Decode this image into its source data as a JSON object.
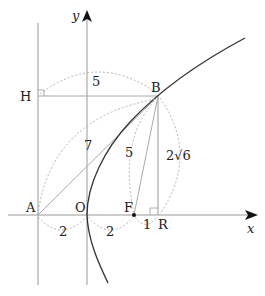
{
  "diagram": {
    "axes": {
      "x_label": "x",
      "y_label": "y"
    },
    "points": {
      "A": "A",
      "O": "O",
      "F": "F",
      "R": "R",
      "B": "B",
      "H": "H"
    },
    "lengths": {
      "HB": "5",
      "AB": "7",
      "FB": "5",
      "BR": "2√6",
      "AO": "2",
      "OF": "2",
      "FR": "1"
    },
    "colors": {
      "curve": "#333333",
      "lines": "#999999",
      "dotted": "#aaaaaa"
    }
  }
}
